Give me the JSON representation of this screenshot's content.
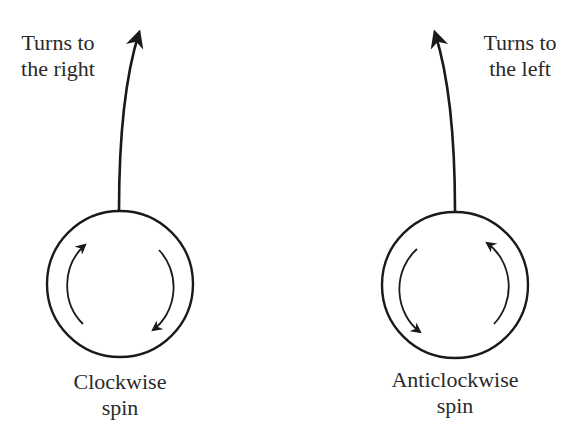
{
  "diagram": {
    "left": {
      "path_label": [
        "Turns to",
        "the right"
      ],
      "spin_label": [
        "Clockwise",
        "spin"
      ],
      "spin_direction": "clockwise",
      "turn_direction": "right"
    },
    "right": {
      "path_label": [
        "Turns to",
        "the left"
      ],
      "spin_label": [
        "Anticlockwise",
        "spin"
      ],
      "spin_direction": "anticlockwise",
      "turn_direction": "left"
    },
    "colors": {
      "stroke": "#1a1a1a",
      "text": "#2a2a2a",
      "background": "#ffffff"
    }
  }
}
